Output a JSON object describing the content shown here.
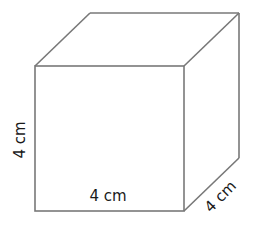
{
  "figure": {
    "type": "cube",
    "stroke_color": "#787878",
    "text_color": "#1a1a1a",
    "front_face": {
      "x": 35,
      "y": 66,
      "width": 149,
      "height": 145
    },
    "depth_offset": {
      "dx": 55,
      "dy": -53
    },
    "labels": {
      "height": "4 cm",
      "width": "4 cm",
      "depth": "4 cm"
    }
  }
}
